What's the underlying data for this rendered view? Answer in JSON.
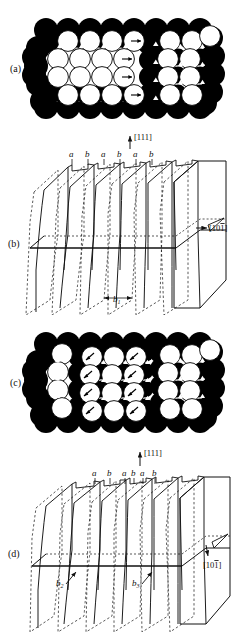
{
  "figure": {
    "domain": "scientific-crystallography-diagram",
    "background_color": "#ffffff",
    "ink_color": "#111111",
    "atom_fill_light": "#ffffff",
    "atom_fill_dark": "#000000",
    "width": 243,
    "height": 632
  },
  "panels": [
    {
      "id": "a",
      "label": "(a)",
      "type": "hard-sphere-packing",
      "description": "Close-packed atomic sphere model with horizontal Burgers vector arrows",
      "arrow_direction": "horizontal",
      "rows": 4,
      "cols": 8
    },
    {
      "id": "b",
      "label": "(b)",
      "type": "lattice-plane-schematic",
      "plane_labels": [
        "a",
        "b",
        "a",
        "b",
        "a",
        "b"
      ],
      "direction_up": "[111]",
      "direction_right_prefix": "[10",
      "direction_right_barred": "1",
      "direction_right_suffix": "]",
      "burgers_vectors": [
        {
          "name": "b",
          "subscript": "1"
        }
      ]
    },
    {
      "id": "c",
      "label": "(c)",
      "type": "hard-sphere-packing",
      "description": "Close-packed atomic sphere model with inclined Burgers vector arrows",
      "arrow_direction": "inclined",
      "rows": 4,
      "cols": 8
    },
    {
      "id": "d",
      "label": "(d)",
      "type": "lattice-plane-schematic",
      "plane_labels": [
        "a",
        "b",
        "a",
        "b",
        "a",
        "b"
      ],
      "direction_up": "[111]",
      "direction_right_prefix": "[10",
      "direction_right_barred": "1",
      "direction_right_suffix": "]",
      "burgers_vectors": [
        {
          "name": "b",
          "subscript": "2"
        },
        {
          "name": "b",
          "subscript": "3"
        }
      ]
    }
  ],
  "text_tokens": {
    "panel_a": "(a)",
    "panel_b": "(b)",
    "panel_c": "(c)",
    "panel_d": "(d)",
    "plane_a": "a",
    "plane_b": "b",
    "dir_111": "[111]",
    "dir_101_pre": "[10",
    "dir_101_bar": "1",
    "dir_101_post": "]",
    "b_letter": "b",
    "sub_1": "1",
    "sub_2": "2",
    "sub_3": "3"
  }
}
